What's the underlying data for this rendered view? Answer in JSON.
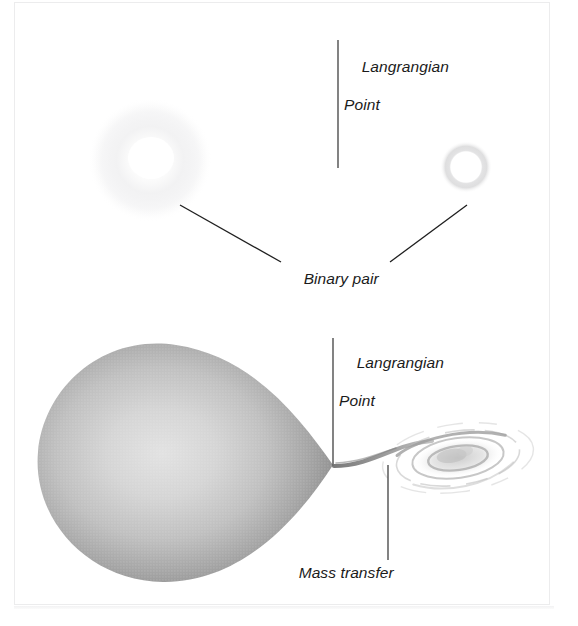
{
  "figure": {
    "background_color": "#ffffff",
    "ink_color": "#1b1b1b",
    "panels": [
      {
        "name": "top-panel",
        "description": "Detached binary pair: two stars separated by the Langrangian point"
      },
      {
        "name": "bottom-panel",
        "description": "Semi-detached binary: Roche-lobe filling star transferring mass through the Langrangian point into an accretion disk"
      }
    ]
  },
  "labels": {
    "lagrangian_top": {
      "line1": "Langrangian",
      "line2": "Point"
    },
    "binary_pair": {
      "line1": "Binary pair"
    },
    "lagrangian_bottom": {
      "line1": "Langrangian",
      "line2": "Point"
    },
    "mass_transfer": {
      "line1": "Mass transfer"
    }
  },
  "objects": {
    "primary_star_top": {
      "name": "diffuse-star",
      "center": [
        150,
        160
      ],
      "radius": 60,
      "core_color": "#ffffff",
      "halo_color": "#f2f2f3"
    },
    "secondary_star_top": {
      "name": "ring-star",
      "center": [
        466,
        167
      ],
      "radius": 24,
      "core_color": "#ffffff",
      "ring_color": "#dddddd"
    },
    "roche_lobe": {
      "name": "roche-lobe-teardrop",
      "left_edge": 37,
      "right_tip": [
        333,
        465
      ],
      "top": 344,
      "bottom": 582,
      "fill_light": "#d7d7d7",
      "fill_dark": "#8e8e8e"
    },
    "accretion_disk": {
      "name": "accretion-disk",
      "center": [
        458,
        458
      ],
      "radius_x": 78,
      "radius_y": 34,
      "ring_color": "#b9b9b9",
      "core_color": "#d0d0d0"
    },
    "mass_stream": {
      "name": "mass-transfer-stream",
      "from": [
        333,
        465
      ],
      "to": [
        420,
        448
      ],
      "color": "#9a9a9a"
    }
  },
  "leaders": {
    "lagrangian_top_line": {
      "x": 338,
      "y1": 40,
      "y2": 168
    },
    "binary_pair_left": {
      "x1": 180,
      "y1": 205,
      "x2": 281,
      "y2": 262
    },
    "binary_pair_right": {
      "x1": 390,
      "y1": 262,
      "x2": 467,
      "y2": 205
    },
    "lagrangian_bottom_line": {
      "x": 333,
      "y1": 338,
      "y2": 466
    },
    "mass_transfer_line": {
      "x": 388,
      "y1": 465,
      "y2": 560
    }
  },
  "colors": {
    "ink": "#1b1b1b",
    "leader": "#303030",
    "page_border": "#ececed",
    "background": "#ffffff"
  }
}
